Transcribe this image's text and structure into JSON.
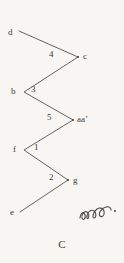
{
  "figure": {
    "caption": "C",
    "background_color": "#f7f6f3",
    "ink_color": "#3a3a3a",
    "width": 124,
    "height": 263,
    "type": "zigzag-line-diagram"
  },
  "nodes": [
    {
      "id": "d",
      "label": "d",
      "x": 10,
      "y": 33,
      "vertex_x": 19,
      "vertex_y": 31,
      "label_side": "left"
    },
    {
      "id": "c",
      "label": "c",
      "x": 84,
      "y": 57,
      "vertex_x": 78,
      "vertex_y": 57,
      "label_side": "right"
    },
    {
      "id": "b",
      "label": "b",
      "x": 13,
      "y": 92,
      "vertex_x": 24,
      "vertex_y": 92,
      "label_side": "left"
    },
    {
      "id": "aa'",
      "label": "aa’",
      "x": 78,
      "y": 121,
      "vertex_x": 73,
      "vertex_y": 120,
      "label_side": "right"
    },
    {
      "id": "f",
      "label": "f",
      "x": 14,
      "y": 150,
      "vertex_x": 24,
      "vertex_y": 150,
      "label_side": "left"
    },
    {
      "id": "g",
      "label": "g",
      "x": 74,
      "y": 181,
      "vertex_x": 68,
      "vertex_y": 180,
      "label_side": "right"
    },
    {
      "id": "e",
      "label": "e",
      "x": 11,
      "y": 213,
      "vertex_x": 20,
      "vertex_y": 212,
      "label_side": "left"
    }
  ],
  "segments": [
    {
      "id": "seg-d-c",
      "from": "d",
      "to": "c",
      "label": "",
      "label_x": 0,
      "label_y": 0
    },
    {
      "id": "seg-c-b",
      "from": "c",
      "to": "b",
      "label": "4",
      "label_x": 50,
      "label_y": 53
    },
    {
      "id": "seg-b-aa",
      "from": "b",
      "to": "aa'",
      "label": "3",
      "label_x": 32,
      "label_y": 88
    },
    {
      "id": "seg-aa-f",
      "from": "aa'",
      "to": "f",
      "label": "5",
      "label_x": 48,
      "label_y": 116
    },
    {
      "id": "seg-f-g",
      "from": "f",
      "to": "g",
      "label": "1",
      "label_x": 34,
      "label_y": 146
    },
    {
      "id": "seg-g-e",
      "from": "g",
      "to": "e",
      "label": "2",
      "label_x": 50,
      "label_y": 176
    }
  ],
  "annotation": {
    "name": "handwritten-scribble",
    "text": "وو"
  }
}
